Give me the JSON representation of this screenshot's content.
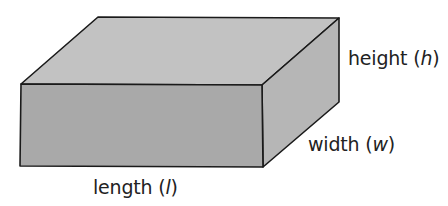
{
  "diagram": {
    "shape": "rectangular-prism",
    "colors": {
      "top_face": "#c2c2c2",
      "front_face": "#a9a9a9",
      "right_face": "#b6b6b6",
      "edge": "#1a1a1a",
      "background": "#ffffff"
    },
    "labels": {
      "height": {
        "word": "height",
        "open": " (",
        "var": "h",
        "close": ")"
      },
      "width": {
        "word": "width",
        "open": " (",
        "var": "w",
        "close": ")"
      },
      "length": {
        "word": "length",
        "open": " (",
        "var": "l",
        "close": ")"
      }
    }
  }
}
